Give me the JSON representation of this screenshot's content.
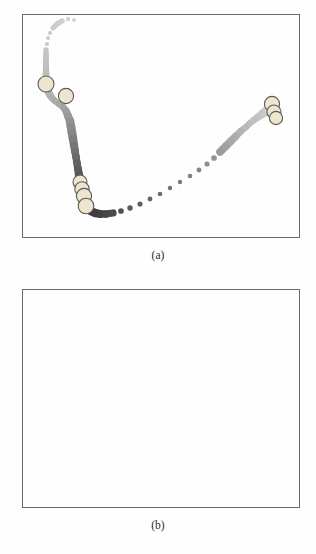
{
  "figure": {
    "panels": [
      {
        "id": "a",
        "caption": "(a)"
      },
      {
        "id": "b",
        "caption": "(b)"
      }
    ]
  },
  "colors": {
    "frame": "#6b6b6b",
    "marker_dark": "#3a3a3a",
    "marker_mid": "#8a8a8a",
    "marker_light": "#cfcfcf",
    "highlight_fill": "#ece6cf",
    "highlight_stroke": "#5a5a5a",
    "background": "#ffffff"
  },
  "chart_data": [
    {
      "type": "scatter",
      "title": "(a)",
      "xlabel": "",
      "ylabel": "",
      "xlim": [
        0,
        100
      ],
      "ylim": [
        0,
        100
      ],
      "grid": false,
      "legend": "none",
      "notes": "Trajectory of graduated markers: a dark descending branch at the left, a light ascending branch sweeping to the lower-right and up to a dark cluster at the right edge. Large pale circles mark selected key points.",
      "series": [
        {
          "name": "trajectory",
          "marker_size_px": [
            3.2,
            3.4,
            3.6,
            3.4,
            3.2,
            3.0,
            3.0,
            3.2,
            3.4,
            3.6,
            3.8,
            4.0,
            4.2,
            4.6,
            5.0,
            5.0,
            4.6,
            4.2,
            4.0,
            4.0,
            4.2,
            4.6,
            5.0,
            5.4,
            5.6,
            5.6,
            5.4,
            5.2,
            5.0,
            4.8,
            4.8,
            5.0,
            5.2,
            5.4,
            5.6,
            5.8,
            6.0,
            6.2,
            6.0,
            5.8,
            5.6,
            5.4,
            5.2,
            5.0,
            4.8,
            4.6,
            4.4,
            4.2,
            4.0,
            3.8,
            3.6,
            3.4,
            3.4,
            3.6,
            3.8,
            4.0,
            4.4,
            4.8,
            5.0,
            5.0,
            4.6,
            4.2,
            4.0,
            4.0,
            4.2,
            4.6,
            5.0,
            5.6,
            6.2,
            6.8,
            7.2
          ],
          "x": [
            74,
            68,
            62,
            57,
            53,
            50,
            48,
            47,
            46,
            46,
            46,
            46,
            46,
            46,
            47,
            48,
            50,
            52,
            55,
            59,
            63,
            66,
            68,
            70,
            71,
            72,
            73,
            74,
            75,
            76,
            77,
            78,
            79,
            80,
            81,
            82,
            83,
            84,
            85,
            86,
            88,
            91,
            95,
            100,
            106,
            113,
            121,
            130,
            140,
            150,
            160,
            170,
            180,
            190,
            199,
            207,
            214,
            220,
            226,
            231,
            236,
            241,
            246,
            250,
            254,
            258,
            262,
            265,
            268,
            271,
            273
          ],
          "y": [
            20,
            19,
            21,
            24,
            28,
            33,
            38,
            44,
            50,
            56,
            62,
            68,
            74,
            80,
            86,
            91,
            95,
            98,
            101,
            104,
            107,
            111,
            116,
            121,
            127,
            133,
            139,
            145,
            151,
            157,
            163,
            169,
            175,
            181,
            187,
            192,
            196,
            199,
            202,
            205,
            208,
            211,
            213,
            214,
            214,
            213,
            211,
            208,
            204,
            199,
            194,
            188,
            182,
            176,
            170,
            164,
            158,
            152,
            146,
            141,
            136,
            131,
            127,
            123,
            120,
            117,
            114,
            112,
            110,
            108,
            106
          ],
          "shade": [
            0.05,
            0.06,
            0.07,
            0.08,
            0.09,
            0.1,
            0.11,
            0.12,
            0.13,
            0.14,
            0.15,
            0.16,
            0.17,
            0.18,
            0.2,
            0.22,
            0.24,
            0.26,
            0.28,
            0.3,
            0.33,
            0.36,
            0.39,
            0.43,
            0.47,
            0.51,
            0.55,
            0.59,
            0.63,
            0.67,
            0.71,
            0.75,
            0.78,
            0.81,
            0.84,
            0.87,
            0.89,
            0.91,
            0.93,
            0.94,
            0.95,
            0.95,
            0.94,
            0.92,
            0.89,
            0.86,
            0.82,
            0.78,
            0.74,
            0.7,
            0.66,
            0.62,
            0.58,
            0.54,
            0.5,
            0.46,
            0.42,
            0.38,
            0.34,
            0.3,
            0.27,
            0.24,
            0.21,
            0.18,
            0.16,
            0.14,
            0.12,
            0.1,
            0.08,
            0.06,
            0.05
          ]
        }
      ],
      "highlights": [
        {
          "x": 46,
          "y": 84,
          "r": 8.0
        },
        {
          "x": 66,
          "y": 96,
          "r": 7.6
        },
        {
          "x": 80,
          "y": 182,
          "r": 7.0
        },
        {
          "x": 82,
          "y": 189,
          "r": 7.2
        },
        {
          "x": 84,
          "y": 196,
          "r": 7.6
        },
        {
          "x": 86,
          "y": 206,
          "r": 7.8
        },
        {
          "x": 272,
          "y": 104,
          "r": 7.6
        },
        {
          "x": 274,
          "y": 112,
          "r": 7.0
        },
        {
          "x": 276,
          "y": 118,
          "r": 6.6
        }
      ]
    },
    {
      "type": "scatter",
      "title": "(b)",
      "xlabel": "",
      "ylabel": "",
      "xlim": [
        0,
        100
      ],
      "ylim": [
        0,
        100
      ],
      "grid": false,
      "legend": "none",
      "notes": "Same trajectory structure as (a) but the right-hand branch is rendered in much lighter grey and the right-edge cluster is resolved into four separate large pale circles.",
      "series": [
        {
          "name": "trajectory",
          "marker_size_px": [
            3.2,
            3.4,
            3.6,
            3.4,
            3.2,
            3.0,
            3.0,
            3.2,
            3.4,
            3.6,
            3.8,
            4.0,
            4.2,
            4.6,
            5.0,
            5.0,
            4.6,
            4.2,
            4.0,
            4.0,
            4.2,
            4.6,
            5.0,
            5.4,
            5.6,
            5.6,
            5.4,
            5.2,
            5.0,
            4.8,
            4.8,
            5.0,
            5.2,
            5.4,
            5.6,
            5.8,
            6.0,
            6.2,
            6.0,
            5.8,
            5.6,
            5.4,
            5.2,
            5.0,
            4.8,
            4.6,
            4.4,
            4.2,
            4.0,
            3.8,
            3.6,
            3.4,
            3.4,
            3.6,
            3.8,
            4.0,
            4.4,
            4.8,
            5.0,
            5.0,
            4.6,
            4.2,
            4.0,
            4.0,
            4.2,
            4.6,
            5.0,
            5.6,
            6.2,
            6.8,
            7.2
          ],
          "x": [
            74,
            68,
            62,
            57,
            53,
            50,
            48,
            47,
            46,
            46,
            46,
            46,
            46,
            46,
            47,
            48,
            50,
            52,
            55,
            59,
            63,
            66,
            68,
            70,
            71,
            72,
            73,
            74,
            75,
            76,
            77,
            78,
            79,
            80,
            81,
            82,
            83,
            84,
            85,
            86,
            88,
            91,
            95,
            100,
            106,
            113,
            121,
            130,
            140,
            150,
            160,
            170,
            180,
            190,
            199,
            207,
            214,
            220,
            226,
            231,
            236,
            241,
            246,
            250,
            254,
            258,
            262,
            265,
            268,
            271,
            273
          ],
          "y": [
            20,
            19,
            21,
            24,
            28,
            33,
            38,
            44,
            50,
            56,
            62,
            68,
            74,
            80,
            86,
            91,
            95,
            98,
            101,
            104,
            107,
            111,
            116,
            121,
            127,
            133,
            139,
            145,
            151,
            157,
            163,
            169,
            175,
            181,
            187,
            192,
            196,
            199,
            202,
            205,
            208,
            211,
            213,
            214,
            214,
            213,
            211,
            208,
            204,
            199,
            194,
            188,
            182,
            176,
            170,
            164,
            158,
            152,
            146,
            141,
            136,
            131,
            127,
            123,
            120,
            117,
            114,
            112,
            110,
            108,
            106
          ],
          "shade": [
            0.05,
            0.06,
            0.07,
            0.08,
            0.09,
            0.1,
            0.11,
            0.12,
            0.13,
            0.14,
            0.15,
            0.16,
            0.17,
            0.18,
            0.2,
            0.22,
            0.24,
            0.26,
            0.28,
            0.3,
            0.33,
            0.36,
            0.39,
            0.43,
            0.47,
            0.51,
            0.55,
            0.59,
            0.63,
            0.67,
            0.71,
            0.75,
            0.78,
            0.81,
            0.84,
            0.87,
            0.89,
            0.91,
            0.93,
            0.94,
            0.95,
            0.95,
            0.94,
            0.92,
            0.82,
            0.76,
            0.7,
            0.64,
            0.58,
            0.52,
            0.47,
            0.43,
            0.39,
            0.35,
            0.32,
            0.29,
            0.26,
            0.24,
            0.22,
            0.2,
            0.18,
            0.17,
            0.15,
            0.14,
            0.13,
            0.12,
            0.11,
            0.1,
            0.09,
            0.08,
            0.07
          ]
        }
      ],
      "highlights": [
        {
          "x": 46,
          "y": 84,
          "r": 8.0
        },
        {
          "x": 66,
          "y": 96,
          "r": 7.6
        },
        {
          "x": 80,
          "y": 183,
          "r": 7.4
        },
        {
          "x": 82,
          "y": 196,
          "r": 7.6
        },
        {
          "x": 84,
          "y": 209,
          "r": 7.8
        },
        {
          "x": 265,
          "y": 95,
          "r": 7.6
        },
        {
          "x": 272,
          "y": 105,
          "r": 7.4
        },
        {
          "x": 276,
          "y": 117,
          "r": 7.4
        },
        {
          "x": 272,
          "y": 136,
          "r": 7.4
        }
      ]
    }
  ]
}
